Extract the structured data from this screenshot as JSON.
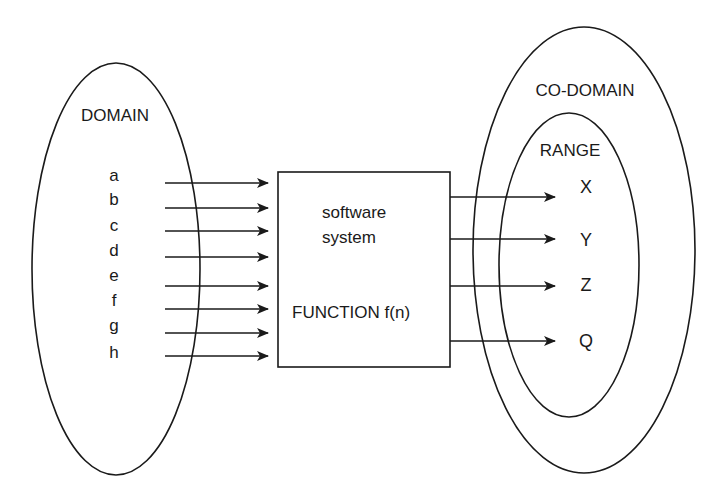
{
  "diagram": {
    "domain": {
      "label": "DOMAIN",
      "items": [
        "a",
        "b",
        "c",
        "d",
        "e",
        "f",
        "g",
        "h"
      ]
    },
    "function_box": {
      "line1": "software",
      "line2": "system",
      "line3": "FUNCTION f(n)"
    },
    "codomain": {
      "label": "CO-DOMAIN"
    },
    "range": {
      "label": "RANGE",
      "items": [
        "X",
        "Y",
        "Z",
        "Q"
      ]
    }
  }
}
